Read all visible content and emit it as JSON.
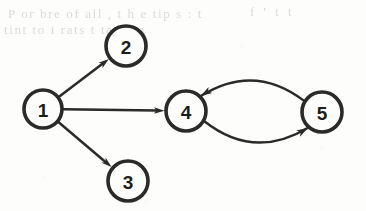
{
  "figure": {
    "type": "directed-graph",
    "background_color": "#fdfdfc",
    "ink_color": "#2a2a28",
    "ghost_text": {
      "line_1": "P  or  bre  of  all ,    t h e  tip s  :  t",
      "line_2": "tint  to  i rats      t         tat    -       m",
      "line_3": "f  ' t  t"
    }
  },
  "chart_data": {
    "type": "diagram",
    "title": "",
    "nodes": [
      {
        "id": "1",
        "label": "1",
        "cx": 43,
        "cy": 109,
        "r": 19
      },
      {
        "id": "2",
        "label": "2",
        "cx": 126,
        "cy": 46,
        "r": 20
      },
      {
        "id": "3",
        "label": "3",
        "cx": 128,
        "cy": 181,
        "r": 20
      },
      {
        "id": "4",
        "label": "4",
        "cx": 186,
        "cy": 111,
        "r": 20
      },
      {
        "id": "5",
        "label": "5",
        "cx": 322,
        "cy": 112,
        "r": 20
      }
    ],
    "edges": [
      {
        "from": "1",
        "to": "2",
        "shape": "straight",
        "directed": true
      },
      {
        "from": "1",
        "to": "3",
        "shape": "straight",
        "directed": true
      },
      {
        "from": "1",
        "to": "4",
        "shape": "straight",
        "directed": true
      },
      {
        "from": "4",
        "to": "5",
        "shape": "curved-below",
        "directed": true
      },
      {
        "from": "5",
        "to": "4",
        "shape": "curved-above",
        "directed": true
      }
    ]
  }
}
